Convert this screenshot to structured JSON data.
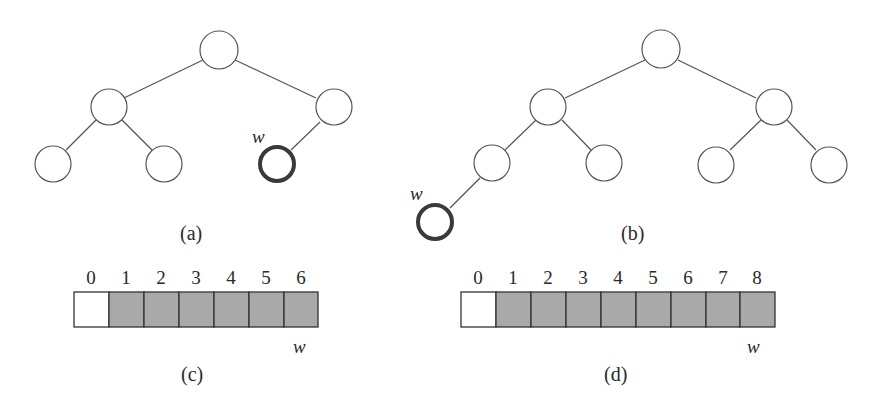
{
  "figure": {
    "panels": [
      {
        "id": "a",
        "caption": "(a)",
        "type": "tree",
        "highlight_label": "w"
      },
      {
        "id": "b",
        "caption": "(b)",
        "type": "tree",
        "highlight_label": "w"
      },
      {
        "id": "c",
        "caption": "(c)",
        "type": "array",
        "indices": [
          "0",
          "1",
          "2",
          "3",
          "4",
          "5",
          "6"
        ],
        "empty_cells": [
          0
        ],
        "filled_color": "#a9a9a9",
        "pointer_label": "w",
        "pointer_index": 6
      },
      {
        "id": "d",
        "caption": "(d)",
        "type": "array",
        "indices": [
          "0",
          "1",
          "2",
          "3",
          "4",
          "5",
          "6",
          "7",
          "8"
        ],
        "empty_cells": [
          0
        ],
        "filled_color": "#a9a9a9",
        "pointer_label": "w",
        "pointer_index": 8
      }
    ],
    "colors": {
      "stroke": "#555555",
      "highlight_stroke": "#3a3a3a",
      "fill_empty": "#ffffff",
      "fill_filled": "#a9a9a9"
    }
  }
}
